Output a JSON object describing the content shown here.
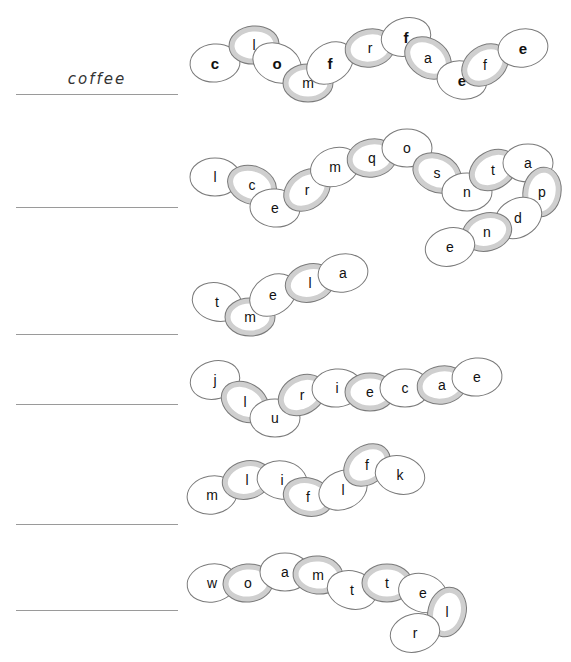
{
  "worksheet": {
    "example_answer": "coffee",
    "answer_lines_y": [
      94,
      207,
      334,
      404,
      524,
      610
    ],
    "colors": {
      "ring_stroke": "#7a7a7a",
      "ring_band_gray": "#cfcfcf",
      "ring_band_white": "#ffffff",
      "line": "#9a9a9a"
    },
    "chains": [
      {
        "id": "chain-1",
        "rings": [
          {
            "l": "c",
            "x": 215,
            "y": 63,
            "b": true,
            "r": -5
          },
          {
            "l": "l",
            "x": 254,
            "y": 45,
            "b": false,
            "r": -5
          },
          {
            "l": "o",
            "x": 277,
            "y": 63,
            "b": true,
            "r": 25
          },
          {
            "l": "m",
            "x": 308,
            "y": 83,
            "b": false,
            "r": 0
          },
          {
            "l": "f",
            "x": 330,
            "y": 63,
            "b": true,
            "r": -35
          },
          {
            "l": "r",
            "x": 370,
            "y": 48,
            "b": false,
            "r": -10
          },
          {
            "l": "f",
            "x": 406,
            "y": 37,
            "b": true,
            "r": -15
          },
          {
            "l": "a",
            "x": 428,
            "y": 58,
            "b": false,
            "r": 35
          },
          {
            "l": "e",
            "x": 462,
            "y": 80,
            "b": true,
            "r": 10
          },
          {
            "l": "f",
            "x": 485,
            "y": 65,
            "b": false,
            "r": -35
          },
          {
            "l": "e",
            "x": 523,
            "y": 48,
            "b": true,
            "r": -10
          }
        ]
      },
      {
        "id": "chain-2",
        "rings": [
          {
            "l": "l",
            "x": 215,
            "y": 177,
            "b": false,
            "r": 0
          },
          {
            "l": "c",
            "x": 252,
            "y": 185,
            "b": false,
            "r": 20
          },
          {
            "l": "e",
            "x": 275,
            "y": 208,
            "b": false,
            "r": 5
          },
          {
            "l": "r",
            "x": 307,
            "y": 190,
            "b": false,
            "r": -35
          },
          {
            "l": "m",
            "x": 335,
            "y": 167,
            "b": false,
            "r": -20
          },
          {
            "l": "q",
            "x": 372,
            "y": 158,
            "b": false,
            "r": -10
          },
          {
            "l": "o",
            "x": 407,
            "y": 148,
            "b": false,
            "r": 0
          },
          {
            "l": "s",
            "x": 437,
            "y": 173,
            "b": false,
            "r": 25
          },
          {
            "l": "n",
            "x": 467,
            "y": 192,
            "b": false,
            "r": 0
          },
          {
            "l": "t",
            "x": 493,
            "y": 170,
            "b": false,
            "r": -30
          },
          {
            "l": "a",
            "x": 528,
            "y": 163,
            "b": false,
            "r": 0
          },
          {
            "l": "p",
            "x": 542,
            "y": 192,
            "b": false,
            "r": -80
          },
          {
            "l": "d",
            "x": 518,
            "y": 218,
            "b": false,
            "r": -30
          },
          {
            "l": "n",
            "x": 487,
            "y": 232,
            "b": false,
            "r": -15
          },
          {
            "l": "e",
            "x": 450,
            "y": 247,
            "b": false,
            "r": -15
          }
        ]
      },
      {
        "id": "chain-3",
        "rings": [
          {
            "l": "t",
            "x": 217,
            "y": 302,
            "b": false,
            "r": 15
          },
          {
            "l": "m",
            "x": 250,
            "y": 317,
            "b": false,
            "r": 0
          },
          {
            "l": "e",
            "x": 273,
            "y": 295,
            "b": false,
            "r": -35
          },
          {
            "l": "l",
            "x": 310,
            "y": 283,
            "b": false,
            "r": -15
          },
          {
            "l": "a",
            "x": 343,
            "y": 273,
            "b": false,
            "r": -10
          }
        ]
      },
      {
        "id": "chain-4",
        "rings": [
          {
            "l": "j",
            "x": 215,
            "y": 380,
            "b": false,
            "r": -15
          },
          {
            "l": "l",
            "x": 245,
            "y": 402,
            "b": false,
            "r": 30
          },
          {
            "l": "u",
            "x": 275,
            "y": 418,
            "b": false,
            "r": 0
          },
          {
            "l": "r",
            "x": 302,
            "y": 395,
            "b": false,
            "r": -30
          },
          {
            "l": "i",
            "x": 337,
            "y": 388,
            "b": false,
            "r": -5
          },
          {
            "l": "e",
            "x": 370,
            "y": 392,
            "b": false,
            "r": 0
          },
          {
            "l": "c",
            "x": 405,
            "y": 388,
            "b": false,
            "r": 0
          },
          {
            "l": "a",
            "x": 442,
            "y": 385,
            "b": false,
            "r": -10
          },
          {
            "l": "e",
            "x": 477,
            "y": 377,
            "b": false,
            "r": -5
          }
        ]
      },
      {
        "id": "chain-5",
        "rings": [
          {
            "l": "m",
            "x": 212,
            "y": 495,
            "b": false,
            "r": -10
          },
          {
            "l": "l",
            "x": 247,
            "y": 480,
            "b": false,
            "r": -15
          },
          {
            "l": "i",
            "x": 282,
            "y": 480,
            "b": false,
            "r": 10
          },
          {
            "l": "f",
            "x": 308,
            "y": 497,
            "b": false,
            "r": 15
          },
          {
            "l": "l",
            "x": 343,
            "y": 490,
            "b": false,
            "r": -25
          },
          {
            "l": "f",
            "x": 367,
            "y": 465,
            "b": false,
            "r": -35
          },
          {
            "l": "k",
            "x": 400,
            "y": 475,
            "b": false,
            "r": 15
          }
        ]
      },
      {
        "id": "chain-6",
        "rings": [
          {
            "l": "w",
            "x": 212,
            "y": 583,
            "b": false,
            "r": -10
          },
          {
            "l": "o",
            "x": 248,
            "y": 583,
            "b": false,
            "r": -5
          },
          {
            "l": "a",
            "x": 285,
            "y": 572,
            "b": false,
            "r": 0
          },
          {
            "l": "m",
            "x": 318,
            "y": 575,
            "b": false,
            "r": 5
          },
          {
            "l": "t",
            "x": 352,
            "y": 590,
            "b": false,
            "r": 15
          },
          {
            "l": "t",
            "x": 387,
            "y": 583,
            "b": false,
            "r": 0
          },
          {
            "l": "e",
            "x": 423,
            "y": 593,
            "b": false,
            "r": 20
          },
          {
            "l": "l",
            "x": 447,
            "y": 612,
            "b": false,
            "r": -75
          },
          {
            "l": "r",
            "x": 415,
            "y": 633,
            "b": false,
            "r": -15
          }
        ]
      }
    ]
  }
}
